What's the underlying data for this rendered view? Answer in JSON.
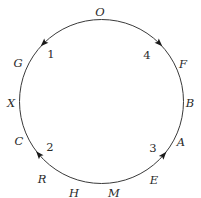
{
  "diagram": {
    "type": "circular-cycle",
    "points": [
      {
        "id": "O",
        "label": "O"
      },
      {
        "id": "F",
        "label": "F"
      },
      {
        "id": "B",
        "label": "B"
      },
      {
        "id": "A",
        "label": "A"
      },
      {
        "id": "E",
        "label": "E"
      },
      {
        "id": "M",
        "label": "M"
      },
      {
        "id": "H",
        "label": "H"
      },
      {
        "id": "R",
        "label": "R"
      },
      {
        "id": "C",
        "label": "C"
      },
      {
        "id": "X",
        "label": "X"
      },
      {
        "id": "G",
        "label": "G"
      }
    ],
    "arcs": [
      {
        "id": "1",
        "label": "1",
        "from": "O",
        "to": "G",
        "direction": "counterclockwise"
      },
      {
        "id": "4",
        "label": "4",
        "from": "O",
        "to": "F",
        "direction": "clockwise"
      },
      {
        "id": "2",
        "label": "2",
        "from": "R",
        "to": "C",
        "direction": "clockwise"
      },
      {
        "id": "3",
        "label": "3",
        "from": "E",
        "to": "A",
        "direction": "counterclockwise"
      }
    ]
  }
}
